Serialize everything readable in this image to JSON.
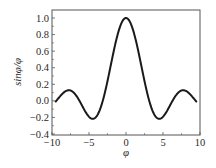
{
  "chart_data": {
    "type": "line",
    "title": "",
    "xlabel": "φ",
    "ylabel": "sinφ/φ",
    "xlim": [
      -10,
      10
    ],
    "ylim": [
      -0.4,
      1.1
    ],
    "grid": false,
    "legend": null,
    "x_ticks": [
      -10,
      -5,
      0,
      5,
      10
    ],
    "x_tick_labels": [
      "−10",
      "−5",
      "0",
      "5",
      "10"
    ],
    "y_ticks": [
      -0.4,
      -0.2,
      0.0,
      0.2,
      0.4,
      0.6,
      0.8,
      1.0
    ],
    "y_tick_labels": [
      "−0.4",
      "−0.2",
      "0.0",
      "0.2",
      "0.4",
      "0.6",
      "0.8",
      "1.0"
    ],
    "series": [
      {
        "name": "sinφ/φ",
        "function": "sin(x)/x",
        "x_range": [
          -9.5,
          9.5
        ],
        "color": "#1a1a1a",
        "key_points": [
          {
            "x": -9.5,
            "y": -0.008
          },
          {
            "x": -7.73,
            "y": 0.128
          },
          {
            "x": -4.49,
            "y": -0.217
          },
          {
            "x": 0,
            "y": 1.0
          },
          {
            "x": 4.49,
            "y": -0.217
          },
          {
            "x": 7.73,
            "y": 0.128
          },
          {
            "x": 9.5,
            "y": -0.008
          }
        ]
      }
    ]
  },
  "colors": {
    "line": "#1a1a1a",
    "frame": "#555555",
    "text": "#2a2a2a",
    "background": "#ffffff"
  }
}
